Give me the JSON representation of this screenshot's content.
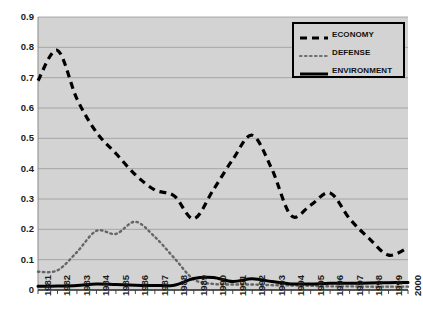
{
  "chart_data": {
    "type": "line",
    "title": "",
    "xlabel": "",
    "ylabel": "",
    "xlim": [
      1981,
      2000
    ],
    "ylim": [
      0,
      0.9
    ],
    "grid": true,
    "legend_position": "top-right",
    "plot_background": "#d3d3d3",
    "x": [
      1981,
      1982,
      1983,
      1984,
      1985,
      1986,
      1987,
      1988,
      1989,
      1990,
      1991,
      1992,
      1993,
      1994,
      1995,
      1996,
      1997,
      1998,
      1999,
      2000
    ],
    "categories": [
      "1981",
      "1982",
      "1983",
      "1984",
      "1985",
      "1986",
      "1987",
      "1988",
      "1989",
      "1990",
      "1991",
      "1992",
      "1993",
      "1994",
      "1995",
      "1996",
      "1997",
      "1998",
      "1999",
      "2000"
    ],
    "ytick_labels": [
      "0",
      "0.1",
      "0.2",
      "0.3",
      "0.4",
      "0.5",
      "0.6",
      "0.7",
      "0.8",
      "0.9"
    ],
    "ytick_values": [
      0,
      0.1,
      0.2,
      0.3,
      0.4,
      0.5,
      0.6,
      0.7,
      0.8,
      0.9
    ],
    "series": [
      {
        "name": "ECONOMY",
        "style": "dashed",
        "color": "#000000",
        "values": [
          0.69,
          0.79,
          0.63,
          0.52,
          0.45,
          0.38,
          0.33,
          0.31,
          0.235,
          0.33,
          0.43,
          0.51,
          0.4,
          0.245,
          0.28,
          0.32,
          0.235,
          0.17,
          0.115,
          0.14
        ]
      },
      {
        "name": "DEFENSE",
        "style": "dotted",
        "color": "#666666",
        "values": [
          0.06,
          0.065,
          0.125,
          0.195,
          0.185,
          0.225,
          0.175,
          0.105,
          0.035,
          0.02,
          0.018,
          0.018,
          0.016,
          0.015,
          0.014,
          0.012,
          0.012,
          0.011,
          0.011,
          0.011
        ]
      },
      {
        "name": "ENVIRONMENT",
        "style": "solid",
        "color": "#000000",
        "values": [
          0.012,
          0.013,
          0.015,
          0.02,
          0.018,
          0.016,
          0.015,
          0.016,
          0.038,
          0.041,
          0.028,
          0.037,
          0.028,
          0.02,
          0.02,
          0.022,
          0.022,
          0.023,
          0.024,
          0.025
        ]
      }
    ]
  },
  "legend": {
    "entries": [
      {
        "label": "ECONOMY",
        "dash": "economy-dash-swatch"
      },
      {
        "label": "DEFENSE",
        "dash": "defense-dot-swatch"
      },
      {
        "label": "ENVIRONMENT",
        "dash": "environment-solid-swatch"
      }
    ]
  }
}
